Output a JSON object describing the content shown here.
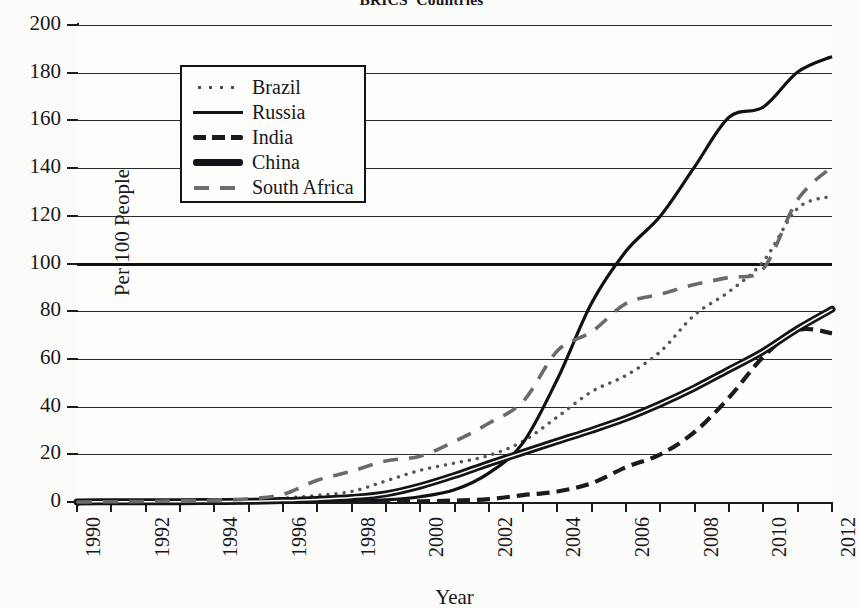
{
  "chart_data": {
    "type": "line",
    "title": "BRICS' Countries",
    "xlabel": "Year",
    "ylabel": "Per 100 People",
    "x": [
      1990,
      1991,
      1992,
      1993,
      1994,
      1995,
      1996,
      1997,
      1998,
      1999,
      2000,
      2001,
      2002,
      2003,
      2004,
      2005,
      2006,
      2007,
      2008,
      2009,
      2010,
      2011,
      2012
    ],
    "xlim": [
      1990,
      2012
    ],
    "ylim": [
      0,
      200
    ],
    "ytick_labels": [
      "0",
      "20",
      "40",
      "60",
      "80",
      "100",
      "120",
      "140",
      "160",
      "180",
      "200"
    ],
    "ytick_values": [
      0,
      20,
      40,
      60,
      80,
      100,
      120,
      140,
      160,
      180,
      200
    ],
    "xtick_labels": [
      "1990",
      "1992",
      "1994",
      "1996",
      "1998",
      "2000",
      "2002",
      "2004",
      "2006",
      "2008",
      "2010",
      "2012"
    ],
    "xtick_values": [
      1990,
      1992,
      1994,
      1996,
      1998,
      2000,
      2002,
      2004,
      2006,
      2008,
      2010,
      2012
    ],
    "grid": true,
    "legend_position": "upper-left",
    "series": [
      {
        "name": "Brazil",
        "style": "dotted",
        "color": "#55555a",
        "values": [
          0,
          0.1,
          0.2,
          0.4,
          0.7,
          1.0,
          1.6,
          2.8,
          4.4,
          8.8,
          13.3,
          16.3,
          19.5,
          25.5,
          35.7,
          46.3,
          53.1,
          63.1,
          78.5,
          88.2,
          100.9,
          123.1,
          128.2
        ]
      },
      {
        "name": "Russia",
        "style": "solid",
        "color": "#111113",
        "values": [
          0,
          0,
          0,
          0,
          0.1,
          0.1,
          0.2,
          0.4,
          0.6,
          0.9,
          2.2,
          5.1,
          12.1,
          24.9,
          51.6,
          83.5,
          105.2,
          119.9,
          140.6,
          161.3,
          165.6,
          180.3,
          186.8
        ]
      },
      {
        "name": "India",
        "style": "dashed",
        "color": "#1b1b1d",
        "values": [
          0,
          0,
          0,
          0,
          0,
          0.1,
          0.1,
          0.1,
          0.1,
          0.2,
          0.3,
          0.6,
          1.2,
          2.9,
          4.4,
          7.9,
          14.6,
          20.0,
          29.4,
          43.8,
          60.9,
          72.0,
          70.8
        ]
      },
      {
        "name": "China",
        "style": "thick-solid",
        "color": "#141416",
        "values": [
          0,
          0.1,
          0.1,
          0.1,
          0.2,
          0.3,
          0.6,
          1.1,
          1.9,
          3.4,
          6.7,
          11.1,
          16.1,
          20.8,
          25.5,
          30.1,
          35.1,
          41.1,
          47.9,
          55.5,
          63.2,
          72.6,
          80.8
        ]
      },
      {
        "name": "South Africa",
        "style": "long-dashed",
        "color": "#6a6a6c",
        "values": [
          0,
          0.1,
          0.2,
          0.5,
          0.8,
          1.3,
          3.2,
          9.1,
          12.9,
          17.2,
          19.2,
          25.4,
          33.0,
          42.2,
          63.4,
          71.4,
          83.3,
          87.1,
          91.2,
          94.2,
          97.9,
          126.8,
          140.6
        ]
      }
    ]
  },
  "legend": {
    "items": [
      {
        "label": "Brazil"
      },
      {
        "label": "Russia"
      },
      {
        "label": "India"
      },
      {
        "label": "China"
      },
      {
        "label": "South Africa"
      }
    ]
  }
}
